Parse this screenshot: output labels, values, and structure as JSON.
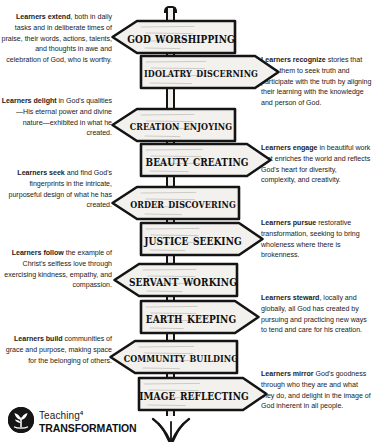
{
  "signs": [
    {
      "label": "God Worshipping",
      "direction": "left"
    },
    {
      "label": "Idolatry Discerning",
      "direction": "right"
    },
    {
      "label": "Creation Enjoying",
      "direction": "left"
    },
    {
      "label": "Beauty Creating",
      "direction": "right"
    },
    {
      "label": "Order Discovering",
      "direction": "left"
    },
    {
      "label": "Justice Seeking",
      "direction": "right"
    },
    {
      "label": "Servant Working",
      "direction": "left"
    },
    {
      "label": "Earth Keeping",
      "direction": "right"
    },
    {
      "label": "Community Building",
      "direction": "left"
    },
    {
      "label": "Image Reflecting",
      "direction": "right"
    }
  ],
  "left_blurbs": [
    {
      "lead": "Learners extend",
      "rest": ", both in daily tasks and in deliberate times of praise, their words, actions, talents, and thoughts in awe and celebration of God, who is worthy."
    },
    {
      "lead": "Learners delight",
      "rest": " in God's qualities—His eternal power and divine nature—exhibited in what he created."
    },
    {
      "lead": "Learners seek",
      "rest": " and find God's fingerprints in the intricate, purposeful design of what he has created."
    },
    {
      "lead": "Learners follow",
      "rest": " the example of Christ's selfless love through exercising kindness, empathy, and compassion."
    },
    {
      "lead": "Learners build",
      "rest": " communities of grace and purpose, making space for the belonging of others."
    }
  ],
  "right_blurbs": [
    {
      "lead": "Learners recognize",
      "rest": " stories that invite them to seek truth and participate with the truth by aligning their learning with the knowledge and person of God."
    },
    {
      "lead": "Learners engage",
      "rest": " in beautiful work that enriches the world and reflects God's heart for diversity, complexity, and creativity."
    },
    {
      "lead": "Learners pursue",
      "rest": " restorative transformation, seeking to bring wholeness where there is brokenness."
    },
    {
      "lead": "Learners steward",
      "rest": ", locally and globally, all God has created by pursuing and practicing new ways to tend and care for his creation."
    },
    {
      "lead": "Learners mirror",
      "rest": " God's goodness through who they are and what they do, and delight in the image of God inherent in all people."
    }
  ],
  "logo": {
    "word_top": "Teaching",
    "word_top_sup": "4",
    "word_bottom": "TRANSFORMATION",
    "mark_icon": "seedling-icon"
  },
  "colors": {
    "ink": "#141414",
    "sign_fill": "#f2f1ee",
    "text": "#1b1b1b",
    "logo_mark": "#151515",
    "background": "#ffffff"
  }
}
